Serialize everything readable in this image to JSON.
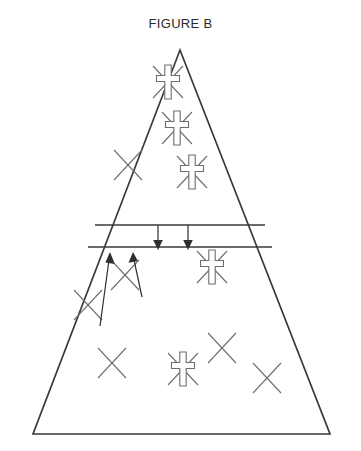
{
  "figure": {
    "title": "FIGURE B",
    "width": 361,
    "height": 451,
    "background_color": "#ffffff",
    "outline_color": "#3a3a3a",
    "symbol_color": "#6e6e6e",
    "arrow_color": "#2f2f2f"
  },
  "triangle": {
    "apex": [
      180,
      50
    ],
    "base_left": [
      33,
      434
    ],
    "base_right": [
      330,
      434
    ],
    "label": "population-pyramid-triangle"
  },
  "band": {
    "name": "middle-band",
    "top_line": {
      "x1": 95,
      "y1": 225,
      "x2": 265,
      "y2": 225
    },
    "bottom_line": {
      "x1": 88,
      "y1": 247,
      "x2": 272,
      "y2": 247
    }
  },
  "regions": [
    {
      "name": "upper-region",
      "symbol_counts": {
        "cross": 3,
        "x": 1
      }
    },
    {
      "name": "band-region",
      "symbol_counts": {
        "cross": 0,
        "x": 0
      }
    },
    {
      "name": "lower-region",
      "symbol_counts": {
        "cross": 2,
        "x": 4
      }
    }
  ],
  "symbols": [
    {
      "id": "upper-cross-1",
      "type": "cross",
      "region": "upper-region",
      "x": 168,
      "y": 82,
      "size": 38
    },
    {
      "id": "upper-cross-2",
      "type": "cross",
      "region": "upper-region",
      "x": 177,
      "y": 128,
      "size": 36
    },
    {
      "id": "upper-cross-3",
      "type": "cross",
      "region": "upper-region",
      "x": 192,
      "y": 172,
      "size": 36
    },
    {
      "id": "upper-x-1",
      "type": "x",
      "region": "upper-region",
      "x": 128,
      "y": 165,
      "size": 30
    },
    {
      "id": "lower-cross-1",
      "type": "cross",
      "region": "lower-region",
      "x": 212,
      "y": 267,
      "size": 36
    },
    {
      "id": "lower-cross-2",
      "type": "cross",
      "region": "lower-region",
      "x": 183,
      "y": 369,
      "size": 36
    },
    {
      "id": "lower-x-1",
      "type": "x",
      "region": "lower-region",
      "x": 125,
      "y": 275,
      "size": 32
    },
    {
      "id": "lower-x-2",
      "type": "x",
      "region": "lower-region",
      "x": 88,
      "y": 305,
      "size": 32
    },
    {
      "id": "lower-x-3",
      "type": "x",
      "region": "lower-region",
      "x": 112,
      "y": 363,
      "size": 32
    },
    {
      "id": "lower-x-4",
      "type": "x",
      "region": "lower-region",
      "x": 222,
      "y": 348,
      "size": 32
    },
    {
      "id": "lower-x-5",
      "type": "x",
      "region": "lower-region",
      "x": 267,
      "y": 378,
      "size": 32
    }
  ],
  "arrows": [
    {
      "id": "down-arrow-1",
      "direction": "down",
      "x1": 158,
      "y1": 225,
      "x2": 158,
      "y2": 248
    },
    {
      "id": "down-arrow-2",
      "direction": "down",
      "x1": 188,
      "y1": 225,
      "x2": 188,
      "y2": 248
    },
    {
      "id": "up-arrow-1",
      "direction": "up",
      "x1": 100,
      "y1": 326,
      "x2": 110,
      "y2": 253
    },
    {
      "id": "up-arrow-2",
      "direction": "up",
      "x1": 142,
      "y1": 297,
      "x2": 133,
      "y2": 253
    }
  ]
}
